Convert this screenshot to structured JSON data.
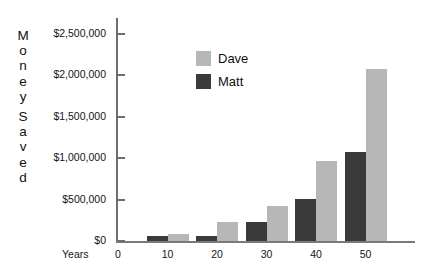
{
  "chart_data": {
    "type": "bar",
    "title": "",
    "xlabel": "Years",
    "ylabel": "Money Saved",
    "categories": [
      "0",
      "10",
      "20",
      "30",
      "40",
      "50"
    ],
    "series": [
      {
        "name": "Dave",
        "color": "#b7b7b7",
        "values": [
          0,
          80000,
          230000,
          420000,
          970000,
          2080000
        ]
      },
      {
        "name": "Matt",
        "color": "#3a3a3a",
        "values": [
          0,
          55000,
          60000,
          230000,
          510000,
          1070000
        ]
      }
    ],
    "ylim": [
      0,
      2700000
    ],
    "yticks": [
      0,
      500000,
      1000000,
      1500000,
      2000000,
      2500000
    ],
    "ytick_labels": [
      "$0",
      "$500,000",
      "$1,000,000",
      "$1,500,000",
      "$2,000,000",
      "$2,500,000"
    ],
    "grid": false,
    "legend_position": "upper-center"
  },
  "axes": {
    "y_title_letters": [
      "M",
      "o",
      "n",
      "e",
      "y",
      "",
      "S",
      "a",
      "v",
      "e",
      "d"
    ],
    "x_title": "Years"
  },
  "legend": {
    "items": [
      {
        "label": "Dave",
        "color": "#b7b7b7"
      },
      {
        "label": "Matt",
        "color": "#3a3a3a"
      }
    ]
  }
}
